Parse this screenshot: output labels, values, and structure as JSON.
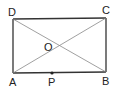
{
  "diagram": {
    "type": "geometry",
    "shape": "rectangle",
    "points": {
      "A": {
        "label": "A",
        "x": 13,
        "y": 73
      },
      "B": {
        "label": "B",
        "x": 106,
        "y": 72
      },
      "C": {
        "label": "C",
        "x": 106,
        "y": 18
      },
      "D": {
        "label": "D",
        "x": 13,
        "y": 19
      },
      "O": {
        "label": "O",
        "x": 59,
        "y": 45
      },
      "P": {
        "label": "P",
        "x": 52,
        "y": 73
      }
    },
    "segments": [
      "AB",
      "BC",
      "CD",
      "DA",
      "AC",
      "BD"
    ]
  },
  "colors": {
    "line": "#333333",
    "diagonal": "#888888",
    "text": "#222222"
  }
}
